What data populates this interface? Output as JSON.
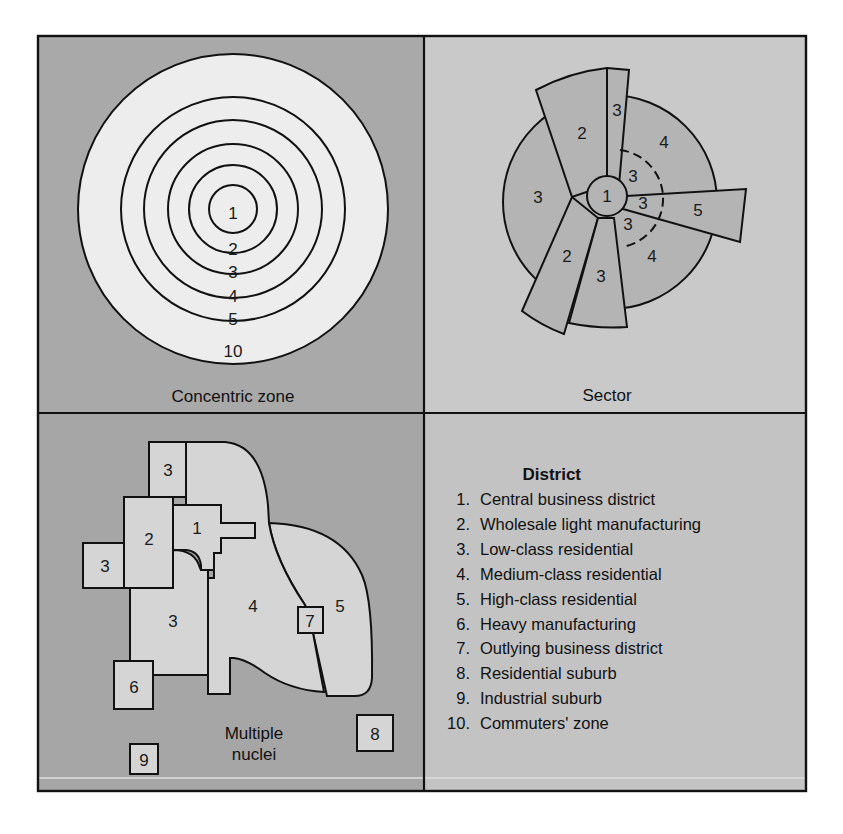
{
  "panels": {
    "concentric": {
      "caption": "Concentric zone",
      "zone_labels": [
        "1",
        "2",
        "3",
        "4",
        "5",
        "10"
      ]
    },
    "sector": {
      "caption": "Sector",
      "labels": {
        "center": "1",
        "top_left_wedge": "2",
        "top_thin_wedge": "3",
        "left_area": "3",
        "upper_right_area": "4",
        "inner_upper": "3",
        "inner_middle": "3",
        "inner_lower": "3",
        "right_wedge": "5",
        "lower_right_area": "4",
        "bottom_left_wedge": "2",
        "bottom_wedge": "3"
      }
    },
    "multiple_nuclei": {
      "caption_line1": "Multiple",
      "caption_line2": "nuclei",
      "labels": {
        "top_block": "3",
        "left_block": "3",
        "wholesale": "2",
        "cbd": "1",
        "lower_residential": "3",
        "medium": "4",
        "high": "5",
        "outlying": "7",
        "heavy": "6",
        "residential_suburb": "8",
        "industrial_suburb": "9"
      }
    },
    "legend": {
      "title": "District",
      "items": [
        {
          "num": "1.",
          "text": "Central business district"
        },
        {
          "num": "2.",
          "text": "Wholesale light manufacturing"
        },
        {
          "num": "3.",
          "text": "Low-class residential"
        },
        {
          "num": "4.",
          "text": "Medium-class residential"
        },
        {
          "num": "5.",
          "text": "High-class residential"
        },
        {
          "num": "6.",
          "text": "Heavy manufacturing"
        },
        {
          "num": "7.",
          "text": "Outlying business district"
        },
        {
          "num": "8.",
          "text": "Residential suburb"
        },
        {
          "num": "9.",
          "text": "Industrial suburb"
        },
        {
          "num": "10.",
          "text": "Commuters' zone"
        }
      ]
    }
  },
  "colors": {
    "panel_dark": "#a9a9a9",
    "panel_light": "#c9c9c9",
    "zone_fill": "#ececec",
    "sector_fill": "#b3b3b3",
    "nuclei_fill": "#d4d4d4",
    "stroke": "#111111"
  }
}
